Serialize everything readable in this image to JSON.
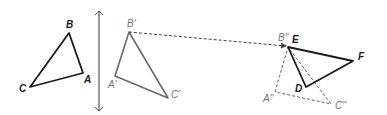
{
  "diagram": {
    "colors": {
      "original": "#1a1a1a",
      "image": "#666666",
      "dashed": "#555555",
      "axis": "#555555"
    },
    "triangle_abc": {
      "label": "triangle ABC",
      "vertices": {
        "A": {
          "label": "A",
          "x": 83,
          "y": 73
        },
        "B": {
          "label": "B",
          "x": 69,
          "y": 33
        },
        "C": {
          "label": "C",
          "x": 30,
          "y": 87
        }
      }
    },
    "reflection_line": {
      "label": "line of reflection",
      "x": 99,
      "y1": 12,
      "y2": 110
    },
    "triangle_a1b1c1": {
      "label": "triangle A'B'C'",
      "vertices": {
        "A1": {
          "label": "A'",
          "x": 115,
          "y": 76
        },
        "B1": {
          "label": "B'",
          "x": 129,
          "y": 32
        },
        "C1": {
          "label": "C'",
          "x": 168,
          "y": 98
        }
      }
    },
    "translation_arrow": {
      "from": "B'",
      "to": "B''"
    },
    "triangle_a2b2c2": {
      "label": "triangle A''B''C''",
      "vertices": {
        "A2": {
          "label": "A''",
          "x": 275,
          "y": 92
        },
        "B2": {
          "label": "B''",
          "x": 288,
          "y": 47
        },
        "C2": {
          "label": "C''",
          "x": 331,
          "y": 104
        }
      }
    },
    "triangle_def": {
      "label": "triangle DEF",
      "vertices": {
        "D": {
          "label": "D",
          "x": 306,
          "y": 87
        },
        "E": {
          "label": "E",
          "x": 288,
          "y": 47
        },
        "F": {
          "label": "F",
          "x": 353,
          "y": 61
        }
      }
    }
  }
}
